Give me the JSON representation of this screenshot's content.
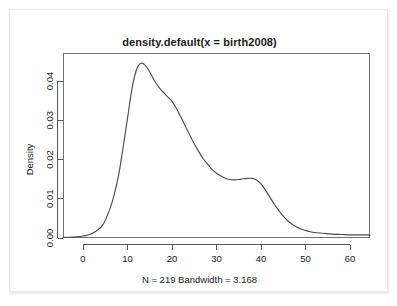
{
  "figure": {
    "title": "density.default(x = birth2008)",
    "subtitle": "N = 219   Bandwidth = 3.168",
    "ylabel": "Density",
    "xlabel": ""
  },
  "axes": {
    "x_ticks": [
      "0",
      "10",
      "20",
      "30",
      "40",
      "50",
      "60"
    ],
    "y_ticks": [
      "0.00",
      "0.01",
      "0.02",
      "0.03",
      "0.04"
    ]
  },
  "colors": {
    "curve": "#4d4d4d",
    "frame": "#737373",
    "text": "#1a1a1a",
    "card_border": "#e9e9e9",
    "background": "#ffffff"
  },
  "chart_data": {
    "type": "line",
    "title": "density.default(x = birth2008)",
    "subtitle": "N = 219   Bandwidth = 3.168",
    "xlabel": "",
    "ylabel": "Density",
    "xlim": [
      -4.5,
      64.5
    ],
    "ylim": [
      -0.0012,
      0.0462
    ],
    "xticks": [
      0,
      10,
      20,
      30,
      40,
      50,
      60
    ],
    "yticks": [
      0.0,
      0.01,
      0.02,
      0.03,
      0.04
    ],
    "grid": false,
    "legend": null,
    "n": 219,
    "bandwidth": 3.168,
    "series": [
      {
        "name": "density",
        "x": [
          -4.5,
          -3,
          -1.5,
          0,
          1.5,
          3,
          4.5,
          6,
          7,
          8,
          9,
          10,
          11,
          12,
          13,
          14,
          15,
          16,
          17,
          18,
          19,
          20,
          21,
          22,
          23,
          24,
          25,
          26,
          27,
          28,
          29,
          30,
          31,
          32,
          33,
          34,
          35,
          36,
          37,
          38,
          39,
          40,
          41,
          42,
          43,
          44,
          45,
          46,
          47,
          48,
          49,
          50,
          51,
          52,
          54,
          56,
          58,
          60,
          62,
          64.5
        ],
        "y": [
          0.0002,
          0.0002,
          0.0003,
          0.0005,
          0.0009,
          0.0018,
          0.0034,
          0.0073,
          0.011,
          0.016,
          0.023,
          0.0305,
          0.038,
          0.0428,
          0.0445,
          0.044,
          0.0423,
          0.0402,
          0.0385,
          0.0372,
          0.036,
          0.0348,
          0.033,
          0.0308,
          0.0285,
          0.0262,
          0.024,
          0.022,
          0.0202,
          0.0188,
          0.0175,
          0.0165,
          0.0158,
          0.0152,
          0.0149,
          0.0148,
          0.0149,
          0.0151,
          0.0152,
          0.0152,
          0.0148,
          0.0138,
          0.0122,
          0.0104,
          0.0086,
          0.007,
          0.0056,
          0.0044,
          0.0035,
          0.0028,
          0.0023,
          0.0019,
          0.0016,
          0.0014,
          0.0012,
          0.001,
          0.0009,
          0.0008,
          0.0008,
          0.0008
        ]
      }
    ]
  }
}
